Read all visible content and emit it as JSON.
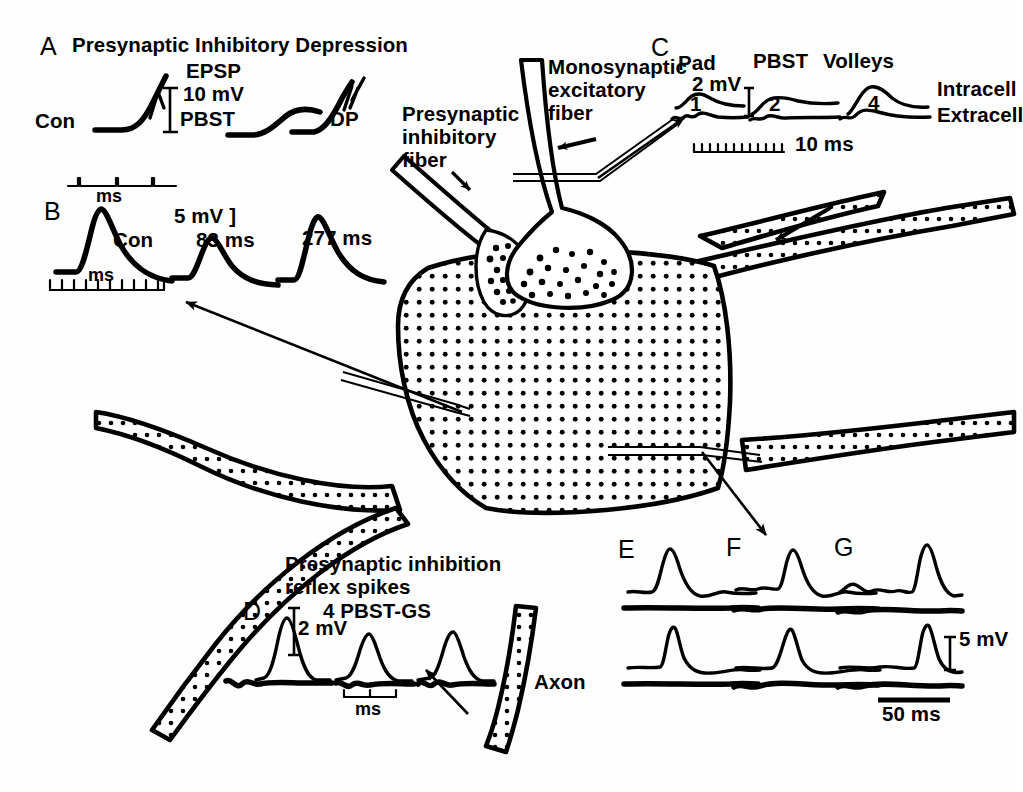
{
  "figure": {
    "background_color": "#ffffff",
    "ink_color": "#000000"
  },
  "panelA": {
    "letter": "A",
    "heading": "Presynaptic Inhibitory Depression",
    "subheading": "EPSP",
    "calibration_voltage": "10 mV",
    "traces": [
      {
        "label": "Con"
      },
      {
        "label": "PBST"
      },
      {
        "label": "DP"
      }
    ]
  },
  "panelB": {
    "letter": "B",
    "time_mark_top": "ms",
    "time_mark_bottom": "ms",
    "calibration_voltage": "5 mV ]",
    "traces": [
      {
        "label": "Con"
      },
      {
        "label": "83 ms"
      },
      {
        "label": "277 ms"
      }
    ]
  },
  "panelC": {
    "letter": "C",
    "stim_labels": [
      "Pad",
      "PBST",
      "Volleys"
    ],
    "calibration_voltage": "2 mV",
    "trace_numbers": [
      "1",
      "2",
      "4"
    ],
    "row_labels": [
      "Intracell",
      "Extracell"
    ],
    "time_scale": "10 ms"
  },
  "panelD": {
    "letter": "D",
    "heading_line1": "Presynaptic inhibition",
    "heading_line2": "reflex spikes",
    "condition": "4 PBST-GS",
    "calibration_voltage": "2 mV",
    "time_mark": "ms"
  },
  "panelEFG": {
    "letters": [
      "E",
      "F",
      "G"
    ],
    "calibration_voltage": "5 mV",
    "time_scale": "50 ms"
  },
  "diagram": {
    "labels": {
      "presynaptic_inhibitory_fiber": [
        "Presynaptic",
        "inhibitory",
        "fiber"
      ],
      "monosynaptic_excitatory_fiber": [
        "Monosynaptic",
        "excitatory",
        "fiber"
      ],
      "axon": "Axon"
    }
  }
}
